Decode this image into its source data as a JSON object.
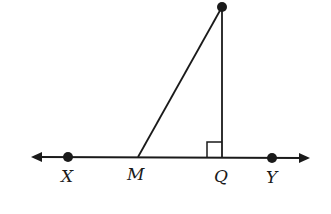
{
  "diagram": {
    "type": "geometry",
    "labels": {
      "X": "X",
      "M": "M",
      "Q": "Q",
      "Y": "Y"
    },
    "right_angle_at": "Q",
    "colors": {
      "stroke": "#1a1a1a",
      "background": "#ffffff"
    }
  }
}
